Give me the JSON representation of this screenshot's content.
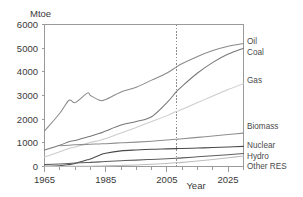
{
  "chart_data": {
    "type": "line",
    "title": "",
    "ylabel": "Mtoe",
    "xlabel": "Year",
    "xlim": [
      1965,
      2030
    ],
    "ylim": [
      0,
      6000
    ],
    "xticks": [
      1965,
      1985,
      2005,
      2025
    ],
    "xtick_labels": [
      "1965",
      "1985",
      "2005",
      "2025"
    ],
    "xminor_step": 5,
    "yticks": [
      0,
      1000,
      2000,
      3000,
      4000,
      5000,
      6000
    ],
    "ytick_labels": [
      "0",
      "1000",
      "2000",
      "3000",
      "4000",
      "5000",
      "6000"
    ],
    "grid": false,
    "legend_position": "right-inline",
    "annotations": [
      {
        "name": "projection-divider",
        "type": "vline",
        "x": 2008,
        "style": "dashed"
      }
    ],
    "x": [
      1965,
      1970,
      1973,
      1975,
      1979,
      1980,
      1983,
      1985,
      1990,
      1995,
      2000,
      2005,
      2008,
      2010,
      2015,
      2020,
      2025,
      2030
    ],
    "series": [
      {
        "name": "Oil",
        "label": "Oil",
        "color": "#8a8a8a",
        "values": [
          1500,
          2250,
          2800,
          2700,
          3100,
          3000,
          2800,
          2830,
          3150,
          3350,
          3650,
          3950,
          4200,
          4350,
          4650,
          4900,
          5080,
          5200
        ]
      },
      {
        "name": "Coal",
        "label": "Coal",
        "color": "#777777",
        "values": [
          700,
          900,
          1050,
          1100,
          1250,
          1280,
          1400,
          1500,
          1750,
          1900,
          2100,
          2700,
          3150,
          3400,
          3950,
          4400,
          4750,
          5000
        ]
      },
      {
        "name": "Gas",
        "label": "Gas",
        "color": "#cccccc",
        "values": [
          400,
          620,
          760,
          820,
          980,
          1020,
          1100,
          1180,
          1420,
          1650,
          1900,
          2150,
          2320,
          2420,
          2700,
          2980,
          3250,
          3500
        ]
      },
      {
        "name": "Biomass",
        "label": "Biomass",
        "color": "#8f8f8f",
        "values": [
          null,
          880,
          900,
          915,
          935,
          940,
          955,
          965,
          1000,
          1030,
          1070,
          1120,
          1150,
          1170,
          1230,
          1290,
          1350,
          1410
        ]
      },
      {
        "name": "Nuclear",
        "label": "Nuclear",
        "color": "#4a4a4a",
        "values": [
          10,
          30,
          80,
          130,
          280,
          320,
          480,
          560,
          660,
          700,
          730,
          745,
          755,
          760,
          780,
          800,
          825,
          850
        ]
      },
      {
        "name": "Hydro",
        "label": "Hydro",
        "color": "#5e5e5e",
        "values": [
          80,
          110,
          130,
          145,
          170,
          175,
          195,
          210,
          245,
          270,
          300,
          330,
          350,
          365,
          410,
          455,
          500,
          545
        ]
      },
      {
        "name": "Other RES",
        "label": "Other RES",
        "color": "#bdbdbd",
        "values": [
          2,
          4,
          6,
          8,
          12,
          14,
          20,
          26,
          45,
          65,
          95,
          130,
          155,
          175,
          235,
          300,
          370,
          440
        ]
      }
    ]
  },
  "colors": {
    "axis": "#9a9a9a",
    "text": "#3a3a3a",
    "background": "#ffffff",
    "marker": "#8d8d8d"
  }
}
